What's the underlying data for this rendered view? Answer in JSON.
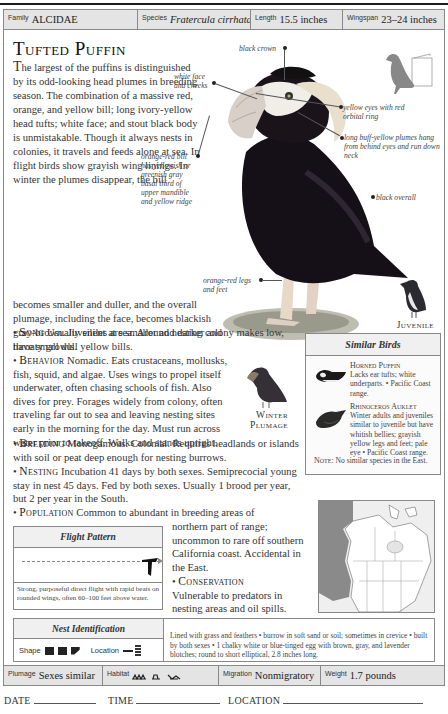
{
  "header": {
    "family_label": "Family",
    "family_value": "ALCIDAE",
    "species_label": "Species",
    "species_value": "Fratercula cirrhata",
    "length_label": "Length",
    "length_value": "15.5 inches",
    "wingspan_label": "Wingspan",
    "wingspan_value": "23–24 inches"
  },
  "title": "Tufted Puffin",
  "intro": {
    "drop_cap": "T",
    "text_narrow": "he largest of the puffins is distinguished by its odd-looking head plumes in breeding season. The combination of a massive red, orange, and yellow bill; long ivory-yellow head tufts; white face; and stout black body is unmistakable. Though it always nests in colonies, it travels and feeds alone at sea. In flight birds show grayish wing linings. In winter the plumes disappear, the bill",
    "text_wide": "becomes smaller and duller, and the overall plumage, including the face, becomes blackish gray-brown. Juveniles are smaller and darker and have small dull yellow bills."
  },
  "sections": {
    "song": {
      "label": "Song",
      "text": "Usually silent at sea. Around nesting colony makes low, throaty growls."
    },
    "behavior": {
      "label": "Behavior",
      "text": "Nomadic. Eats crustaceans, mollusks, fish, squid, and algae. Uses wings to propel itself underwater, often chasing schools of fish. Also dives for prey. Forages widely from colony, often traveling far out to sea and leaving nesting sites early in the morning for the day. Must run across water prior to takeoff. Walks and stands upright."
    },
    "breeding": {
      "label": "Breeding",
      "text": "Monogamous. Colonial. Requires headlands or islands with soil or peat deep enough for nesting burrows."
    },
    "nesting": {
      "label": "Nesting",
      "text": "Incubation 41 days by both sexes. Semiprecocial young stay in nest 45 days. Fed by both sexes. Usually 1 brood per year, but 2 per year in the South."
    },
    "population": {
      "label": "Population",
      "text_a": "Common to abundant in breeding areas of",
      "text_b": "northern part of range; uncommon to rare off southern California coast. Accidental in the East."
    },
    "conservation": {
      "label": "Conservation",
      "text": "Vulnerable to predators in nesting areas and oil spills."
    }
  },
  "callouts": {
    "black_crown": "black crown",
    "white_face": "white face and cheeks",
    "yellow_eyes": "yellow eyes with red orbital ring",
    "plumes": "long buff-yellow plumes hang from behind eyes and run down neck",
    "bill": "orange-red bill has yellowish or greenish gray basal third of upper mandible and yellow ridge",
    "black_overall": "black overall",
    "legs": "orange-red legs and feet"
  },
  "labels": {
    "juvenile": "Juvenile",
    "winter_plumage_1": "Winter",
    "winter_plumage_2": "Plumage"
  },
  "similar_birds": {
    "title": "Similar Birds",
    "items": [
      {
        "name": "Horned Puffin",
        "text": "Lacks ear tufts; white underparts. • Pacific Coast range."
      },
      {
        "name": "Rhinoceros Auklet",
        "text": "Winter adults and juveniles similar to juvenile but have whitish bellies; grayish yellow legs and feet; pale eye • Pacific Coast range."
      }
    ],
    "note_label": "Note:",
    "note_text": "No similar species in the East."
  },
  "flight_pattern": {
    "title": "Flight Pattern",
    "description": "Strong, purposeful direct flight with rapid beats on rounded wings, often 60–100 feet above water."
  },
  "nest_identification": {
    "title": "Nest Identification",
    "shape_label": "Shape",
    "location_label": "Location",
    "description": "Lined with grass and feathers • burrow in soft sand or soil; sometimes in crevice • built by both sexes • 1 chalky white or blue-tinged egg with brown, gray, and lavender blotches; round to short elliptical, 2.8 inches long."
  },
  "footer": {
    "plumage_label": "Plumage",
    "plumage_value": "Sexes similar",
    "habitat_label": "Habitat",
    "migration_label": "Migration",
    "migration_value": "Nonmigratory",
    "weight_label": "Weight",
    "weight_value": "1.7 pounds"
  },
  "log": {
    "date_label": "DATE",
    "time_label": "TIME",
    "location_label": "LOCATION"
  },
  "colors": {
    "strip_bg": "#e4e4e4",
    "border": "#888888",
    "range_shade": "#8a8a8a",
    "text": "#333333"
  }
}
